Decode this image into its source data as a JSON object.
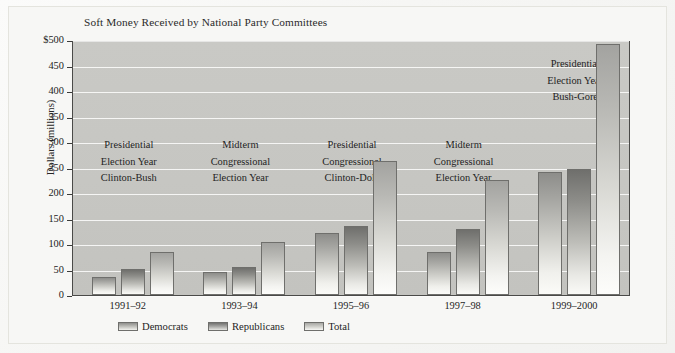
{
  "figure": {
    "title": "Soft Money Received by National Party Committees",
    "ylabel": "Dollars (millions)"
  },
  "legend": {
    "items": [
      {
        "label": "Democrats",
        "swatch": "dem"
      },
      {
        "label": "Republicans",
        "swatch": "rep"
      },
      {
        "label": "Total",
        "swatch": "total"
      }
    ]
  },
  "yaxis": {
    "ticks": [
      "$500",
      "450",
      "400",
      "350",
      "300",
      "250",
      "200",
      "150",
      "100",
      "50",
      "0"
    ]
  },
  "annotations": [
    {
      "lines": [
        "Presidential",
        "Election Year",
        "Clinton-Bush"
      ]
    },
    {
      "lines": [
        "Midterm",
        "Congressional",
        "Election Year"
      ]
    },
    {
      "lines": [
        "Presidential",
        "Congressional",
        "Clinton-Dole"
      ]
    },
    {
      "lines": [
        "Midterm",
        "Congressional",
        "Election Year"
      ]
    },
    {
      "lines": [
        "Presidential",
        "Election Year",
        "Bush-Gore"
      ]
    }
  ],
  "chart_data": {
    "type": "bar",
    "title": "Soft Money Received by National Party Committees",
    "xlabel": "",
    "ylabel": "Dollars (millions)",
    "ylim": [
      0,
      500
    ],
    "ytick_step": 50,
    "grid": true,
    "legend_position": "bottom",
    "categories": [
      "1991–92",
      "1993–94",
      "1995–96",
      "1997–98",
      "1999–2000"
    ],
    "series": [
      {
        "name": "Democrats",
        "values": [
          36,
          45,
          122,
          84,
          241
        ]
      },
      {
        "name": "Republicans",
        "values": [
          51,
          55,
          136,
          129,
          248
        ]
      },
      {
        "name": "Total",
        "values": [
          85,
          104,
          263,
          225,
          492
        ]
      }
    ],
    "annotations": [
      {
        "category": "1991–92",
        "text": "Presidential Election Year Clinton-Bush"
      },
      {
        "category": "1993–94",
        "text": "Midterm Congressional Election Year"
      },
      {
        "category": "1995–96",
        "text": "Presidential Congressional Clinton-Dole"
      },
      {
        "category": "1997–98",
        "text": "Midterm Congressional Election Year"
      },
      {
        "category": "1999–2000",
        "text": "Presidential Election Year Bush-Gore"
      }
    ]
  },
  "colors": {
    "plot_background": "#c6c6c2",
    "gridline": "#fcfcfa",
    "bar_outline": "#6f6f6c",
    "text": "#1f1f1f"
  }
}
